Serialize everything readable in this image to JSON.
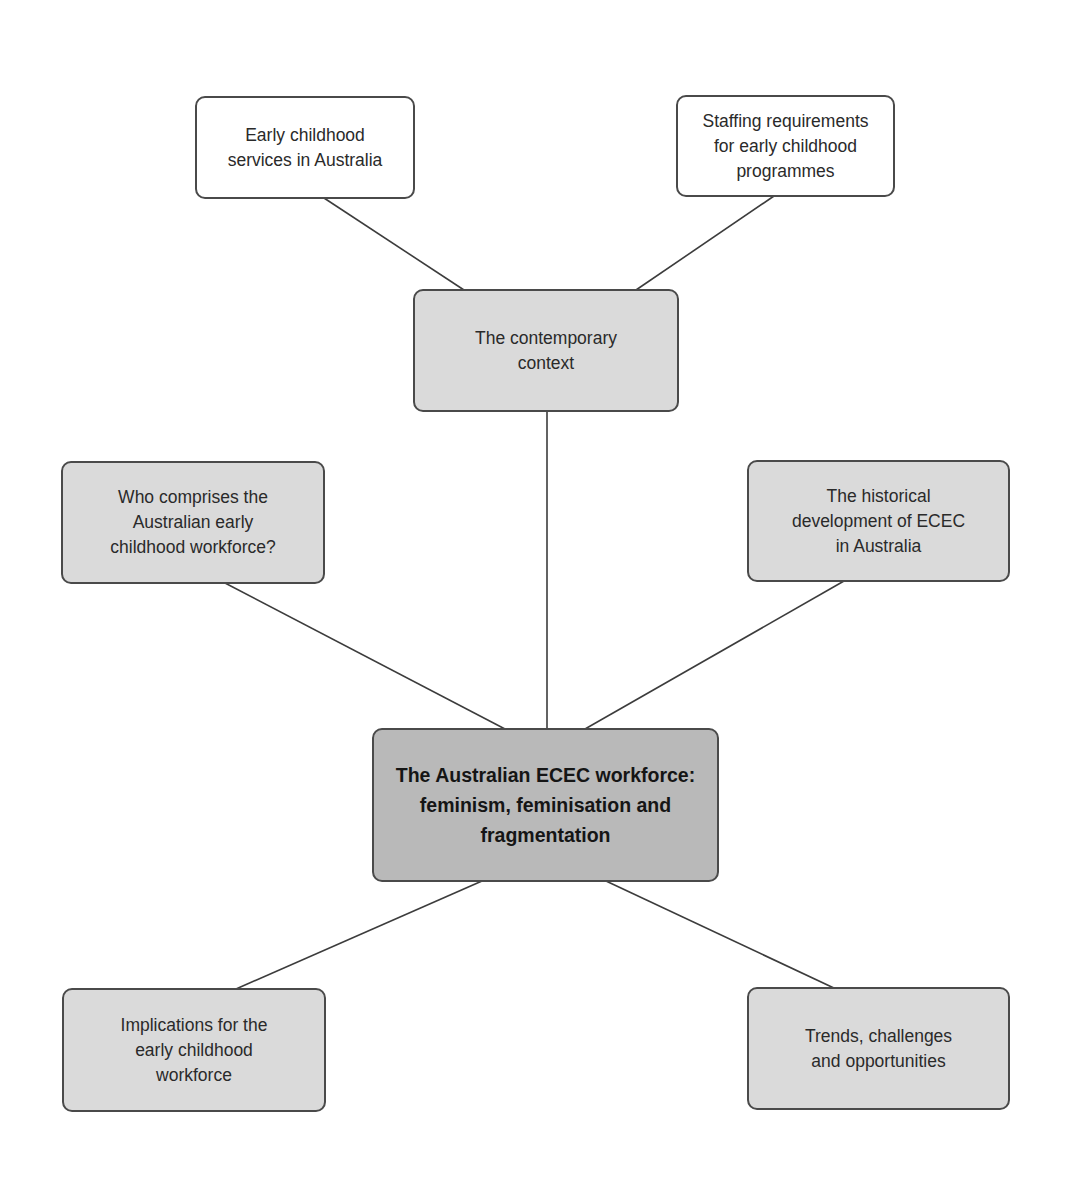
{
  "diagram": {
    "type": "concept-map",
    "colors": {
      "white_box": "#ffffff",
      "grey_box": "#dadada",
      "central_box": "#b9b9b9",
      "border": "#4a4a4a",
      "line": "#3c3c3c"
    },
    "central": {
      "label": "The Australian ECEC workforce:\nfeminism, feminisation and\nfragmentation"
    },
    "nodes": {
      "early_childhood_services": {
        "label": "Early childhood\nservices in Australia"
      },
      "staffing_requirements": {
        "label": "Staffing requirements\nfor early childhood\nprogrammes"
      },
      "contemporary_context": {
        "label": "The contemporary\ncontext"
      },
      "who_comprises": {
        "label": "Who comprises the\nAustralian early\nchildhood workforce?"
      },
      "historical_development": {
        "label": "The historical\ndevelopment of ECEC\nin Australia"
      },
      "implications": {
        "label": "Implications for the\nearly childhood\nworkforce"
      },
      "trends": {
        "label": "Trends, challenges\nand opportunities"
      }
    },
    "edges": [
      [
        "early_childhood_services",
        "contemporary_context"
      ],
      [
        "staffing_requirements",
        "contemporary_context"
      ],
      [
        "contemporary_context",
        "central"
      ],
      [
        "who_comprises",
        "central"
      ],
      [
        "historical_development",
        "central"
      ],
      [
        "central",
        "implications"
      ],
      [
        "central",
        "trends"
      ]
    ]
  }
}
